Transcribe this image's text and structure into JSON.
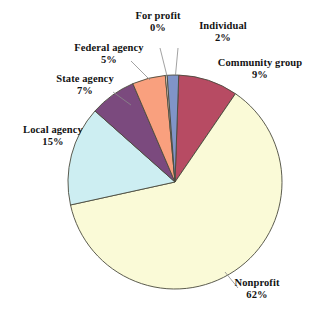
{
  "chart_data": {
    "type": "pie",
    "title": "",
    "subtitle": "",
    "xlabel": "",
    "ylabel": "",
    "legend": "none",
    "grid": false,
    "value_unit": "percent",
    "categories": [
      "Community group",
      "Nonprofit",
      "Local agency",
      "State agency",
      "Federal agency",
      "For profit",
      "Individual"
    ],
    "values": [
      9,
      62,
      15,
      7,
      5,
      0,
      2
    ],
    "slices": [
      {
        "label": "Community group",
        "value": 9,
        "value_text": "9%",
        "color": "#B74B63",
        "start_angle": 2,
        "end_angle": 34.4
      },
      {
        "label": "Nonprofit",
        "value": 62,
        "value_text": "62%",
        "color": "#FAFAD7",
        "start_angle": 34.4,
        "end_angle": 257.6
      },
      {
        "label": "Local agency",
        "value": 15,
        "value_text": "15%",
        "color": "#CDEEF2",
        "start_angle": 257.6,
        "end_angle": 311.6
      },
      {
        "label": "State agency",
        "value": 7,
        "value_text": "7%",
        "color": "#7B4A7E",
        "start_angle": 311.6,
        "end_angle": 336.8
      },
      {
        "label": "Federal agency",
        "value": 5,
        "value_text": "5%",
        "color": "#F9A07E",
        "start_angle": 336.8,
        "end_angle": 354.8
      },
      {
        "label": "For profit",
        "value": 0,
        "value_text": "0%",
        "color": "#F6DCCB",
        "start_angle": 354.8,
        "end_angle": 355.8
      },
      {
        "label": "Individual",
        "value": 2,
        "value_text": "2%",
        "color": "#8094C8",
        "start_angle": 355.8,
        "end_angle": 362
      }
    ],
    "outline_color": "#4A4A3C",
    "background": "#FFFFFF"
  },
  "labels": {
    "for_profit": {
      "name": "For profit",
      "pct": "0%"
    },
    "individual": {
      "name": "Individual",
      "pct": "2%"
    },
    "community_group": {
      "name": "Community group",
      "pct": "9%"
    },
    "federal_agency": {
      "name": "Federal agency",
      "pct": "5%"
    },
    "state_agency": {
      "name": "State agency",
      "pct": "7%"
    },
    "local_agency": {
      "name": "Local agency",
      "pct": "15%"
    },
    "nonprofit": {
      "name": "Nonprofit",
      "pct": "62%"
    }
  }
}
